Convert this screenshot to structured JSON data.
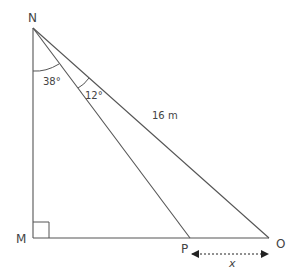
{
  "diagram": {
    "type": "right-triangle-geometry",
    "vertices": {
      "N": {
        "label": "N",
        "x": 33,
        "y": 28
      },
      "M": {
        "label": "M",
        "x": 33,
        "y": 238
      },
      "P": {
        "label": "P",
        "x": 190,
        "y": 238
      },
      "O": {
        "label": "O",
        "x": 269,
        "y": 238
      }
    },
    "angles": {
      "MNP": "38°",
      "PNO": "12°"
    },
    "lengths": {
      "NO": "16 m"
    },
    "unknown": {
      "PO": "x"
    },
    "right_angle_at": "M",
    "line_color": "#555555"
  }
}
